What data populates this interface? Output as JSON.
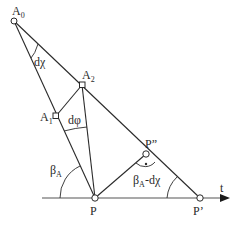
{
  "diagram": {
    "points": {
      "A0": {
        "label": "A",
        "sub": "0"
      },
      "A1": {
        "label": "A",
        "sub": "1"
      },
      "A2": {
        "label": "A",
        "sub": "2"
      },
      "P": {
        "label": "P"
      },
      "P2": {
        "label": "P”"
      },
      "P1": {
        "label": "P’"
      }
    },
    "angles": {
      "dchi": "dχ",
      "dphi": "dφ",
      "betaA": {
        "main": "β",
        "sub": "A"
      },
      "betaA_minus": {
        "main": "β",
        "sub": "A",
        "rest": "-dχ"
      }
    },
    "axis_label": "t",
    "right_angle_marker": "·"
  }
}
